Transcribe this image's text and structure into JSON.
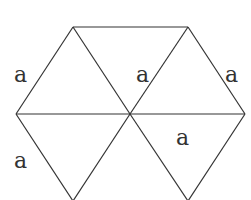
{
  "diagram": {
    "type": "hexagon-of-equilateral-triangles",
    "stroke_color": "#333333",
    "background": "#ffffff",
    "vertices": {
      "top_left": [
        73,
        27
      ],
      "top_right": [
        188,
        27
      ],
      "left": [
        16,
        114
      ],
      "center": [
        130,
        114
      ],
      "right": [
        245,
        114
      ],
      "bottom_left": [
        73,
        201
      ],
      "bottom_right": [
        188,
        201
      ]
    },
    "labels": [
      {
        "text": "a",
        "x": 16,
        "y": 83
      },
      {
        "text": "a",
        "x": 137,
        "y": 83
      },
      {
        "text": "a",
        "x": 226,
        "y": 83
      },
      {
        "text": "a",
        "x": 178,
        "y": 145
      },
      {
        "text": "a",
        "x": 16,
        "y": 168
      }
    ]
  }
}
